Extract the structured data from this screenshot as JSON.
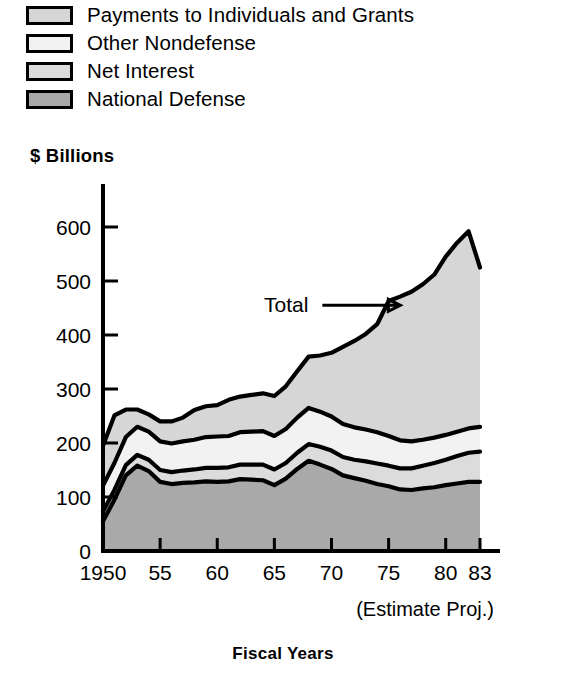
{
  "legend": {
    "items": [
      {
        "label": "Payments to Individuals and Grants",
        "color": "#d6d6d6",
        "swatch_name": "legend-swatch-payments"
      },
      {
        "label": "Other Nondefense",
        "color": "#f2f2f2",
        "swatch_name": "legend-swatch-other-nondefense"
      },
      {
        "label": "Net Interest",
        "color": "#dcdcdc",
        "swatch_name": "legend-swatch-net-interest"
      },
      {
        "label": "National Defense",
        "color": "#a9a9a9",
        "swatch_name": "legend-swatch-national-defense"
      }
    ]
  },
  "axis_titles": {
    "y": "$ Billions",
    "x": "Fiscal Years",
    "estimate_note": "(Estimate Proj.)"
  },
  "annotations": [
    {
      "text": "Total",
      "x_year": 1968.5,
      "y_value": 455
    }
  ],
  "chart_data": {
    "type": "area",
    "title": "",
    "subtitle": "",
    "xlabel": "Fiscal Years",
    "ylabel": "$ Billions",
    "xlim": [
      1950,
      1983
    ],
    "ylim": [
      0,
      650
    ],
    "yticks": [
      0,
      100,
      200,
      300,
      400,
      500,
      600
    ],
    "xticks": [
      1950,
      1955,
      1960,
      1965,
      1970,
      1975,
      1980,
      1983
    ],
    "xtick_labels": [
      "1950",
      "55",
      "60",
      "65",
      "70",
      "75",
      "80",
      "83"
    ],
    "grid": false,
    "legend_position": "above-plot",
    "stacked": true,
    "stack_order_bottom_to_top": [
      "National Defense",
      "Net Interest",
      "Other Nondefense",
      "Payments to Individuals and Grants"
    ],
    "x": [
      1950,
      1951,
      1952,
      1953,
      1954,
      1955,
      1956,
      1957,
      1958,
      1959,
      1960,
      1961,
      1962,
      1963,
      1964,
      1965,
      1966,
      1967,
      1968,
      1969,
      1970,
      1971,
      1972,
      1973,
      1974,
      1975,
      1976,
      1977,
      1978,
      1979,
      1980,
      1981,
      1982,
      1983
    ],
    "series": [
      {
        "name": "National Defense",
        "color": "#a9a9a9",
        "values": [
          55,
          95,
          140,
          158,
          148,
          128,
          124,
          126,
          127,
          129,
          128,
          129,
          133,
          132,
          131,
          122,
          134,
          152,
          167,
          160,
          152,
          140,
          135,
          130,
          124,
          120,
          114,
          113,
          116,
          118,
          122,
          125,
          128,
          128
        ]
      },
      {
        "name": "Net Interest",
        "color": "#dcdcdc",
        "values": [
          18,
          18,
          19,
          20,
          21,
          22,
          22,
          23,
          24,
          25,
          26,
          26,
          27,
          28,
          29,
          29,
          29,
          30,
          31,
          33,
          34,
          34,
          34,
          36,
          38,
          38,
          39,
          40,
          42,
          45,
          47,
          51,
          54,
          56
        ]
      },
      {
        "name": "Other Nondefense",
        "color": "#f2f2f2",
        "values": [
          48,
          50,
          52,
          52,
          52,
          53,
          53,
          54,
          55,
          57,
          58,
          58,
          60,
          61,
          62,
          62,
          63,
          65,
          67,
          65,
          63,
          61,
          60,
          59,
          58,
          55,
          52,
          50,
          48,
          47,
          46,
          45,
          45,
          46
        ]
      },
      {
        "name": "Payments to Individuals and Grants",
        "color": "#d6d6d6",
        "values": [
          74,
          88,
          51,
          32,
          32,
          37,
          41,
          44,
          55,
          57,
          58,
          67,
          66,
          68,
          70,
          74,
          79,
          86,
          95,
          104,
          118,
          143,
          160,
          177,
          200,
          250,
          266,
          277,
          288,
          302,
          330,
          350,
          365,
          295
        ]
      }
    ],
    "total_values": [
      195,
      251,
      262,
      262,
      253,
      240,
      240,
      247,
      261,
      268,
      270,
      280,
      286,
      289,
      292,
      287,
      305,
      333,
      360,
      362,
      367,
      378,
      389,
      402,
      420,
      463,
      471,
      480,
      494,
      512,
      545,
      571,
      592,
      525
    ]
  }
}
